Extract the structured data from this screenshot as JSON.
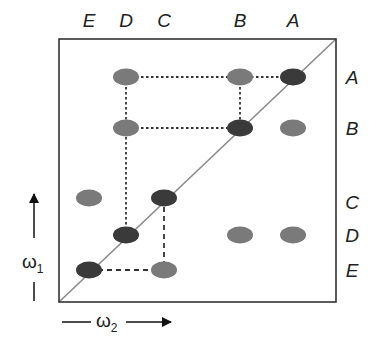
{
  "diagram": {
    "type": "2D correlation spectrum schematic",
    "frame": {
      "x": 59,
      "y": 39,
      "width": 277,
      "height": 263
    },
    "diagonal": {
      "from": [
        59,
        302
      ],
      "to": [
        336,
        39
      ],
      "color": "#8a8a8a"
    },
    "top_labels": [
      {
        "text": "E",
        "x": 89
      },
      {
        "text": "D",
        "x": 126
      },
      {
        "text": "C",
        "x": 164
      },
      {
        "text": "B",
        "x": 240
      },
      {
        "text": "A",
        "x": 293
      }
    ],
    "right_labels": [
      {
        "text": "A",
        "y": 77
      },
      {
        "text": "B",
        "y": 128
      },
      {
        "text": "C",
        "y": 202
      },
      {
        "text": "D",
        "y": 235
      },
      {
        "text": "E",
        "y": 270
      }
    ],
    "x_axis": {
      "symbol": "ω",
      "subscript": "2"
    },
    "y_axis": {
      "symbol": "ω",
      "subscript": "1"
    },
    "colors": {
      "diagonal_peak": "#3a3a3a",
      "cross_peak": "#7a7a7a",
      "frame": "#333333",
      "dashes": "#333333"
    },
    "peaks": [
      {
        "id": "A-A",
        "col": "A",
        "row": "A",
        "x": 293,
        "y": 77,
        "kind": "diagonal"
      },
      {
        "id": "B-B",
        "col": "B",
        "row": "B",
        "x": 240,
        "y": 128,
        "kind": "diagonal"
      },
      {
        "id": "C-C",
        "col": "C",
        "row": "C",
        "x": 164,
        "y": 198,
        "kind": "diagonal"
      },
      {
        "id": "D-D",
        "col": "D",
        "row": "D",
        "x": 126,
        "y": 235,
        "kind": "diagonal"
      },
      {
        "id": "E-E",
        "col": "E",
        "row": "E",
        "x": 89,
        "y": 270,
        "kind": "diagonal"
      },
      {
        "id": "D-A",
        "col": "D",
        "row": "A",
        "x": 126,
        "y": 77,
        "kind": "cross"
      },
      {
        "id": "B-A",
        "col": "B",
        "row": "A",
        "x": 240,
        "y": 77,
        "kind": "cross"
      },
      {
        "id": "D-B",
        "col": "D",
        "row": "B",
        "x": 126,
        "y": 128,
        "kind": "cross"
      },
      {
        "id": "A-B",
        "col": "A",
        "row": "B",
        "x": 293,
        "y": 128,
        "kind": "cross"
      },
      {
        "id": "E-C",
        "col": "E",
        "row": "C",
        "x": 89,
        "y": 198,
        "kind": "cross"
      },
      {
        "id": "B-D",
        "col": "B",
        "row": "D",
        "x": 240,
        "y": 235,
        "kind": "cross"
      },
      {
        "id": "A-D",
        "col": "A",
        "row": "D",
        "x": 293,
        "y": 235,
        "kind": "cross"
      },
      {
        "id": "C-E",
        "col": "C",
        "row": "E",
        "x": 164,
        "y": 270,
        "kind": "cross"
      }
    ],
    "connections": [
      {
        "from": [
          126,
          77
        ],
        "to": [
          293,
          77
        ],
        "style": "dotted"
      },
      {
        "from": [
          126,
          128
        ],
        "to": [
          240,
          128
        ],
        "style": "dotted"
      },
      {
        "from": [
          240,
          77
        ],
        "to": [
          240,
          128
        ],
        "style": "dotted"
      },
      {
        "from": [
          126,
          77
        ],
        "to": [
          126,
          235
        ],
        "style": "dotted"
      },
      {
        "from": [
          164,
          198
        ],
        "to": [
          164,
          270
        ],
        "style": "dashed"
      },
      {
        "from": [
          89,
          270
        ],
        "to": [
          164,
          270
        ],
        "style": "dashed"
      }
    ]
  }
}
